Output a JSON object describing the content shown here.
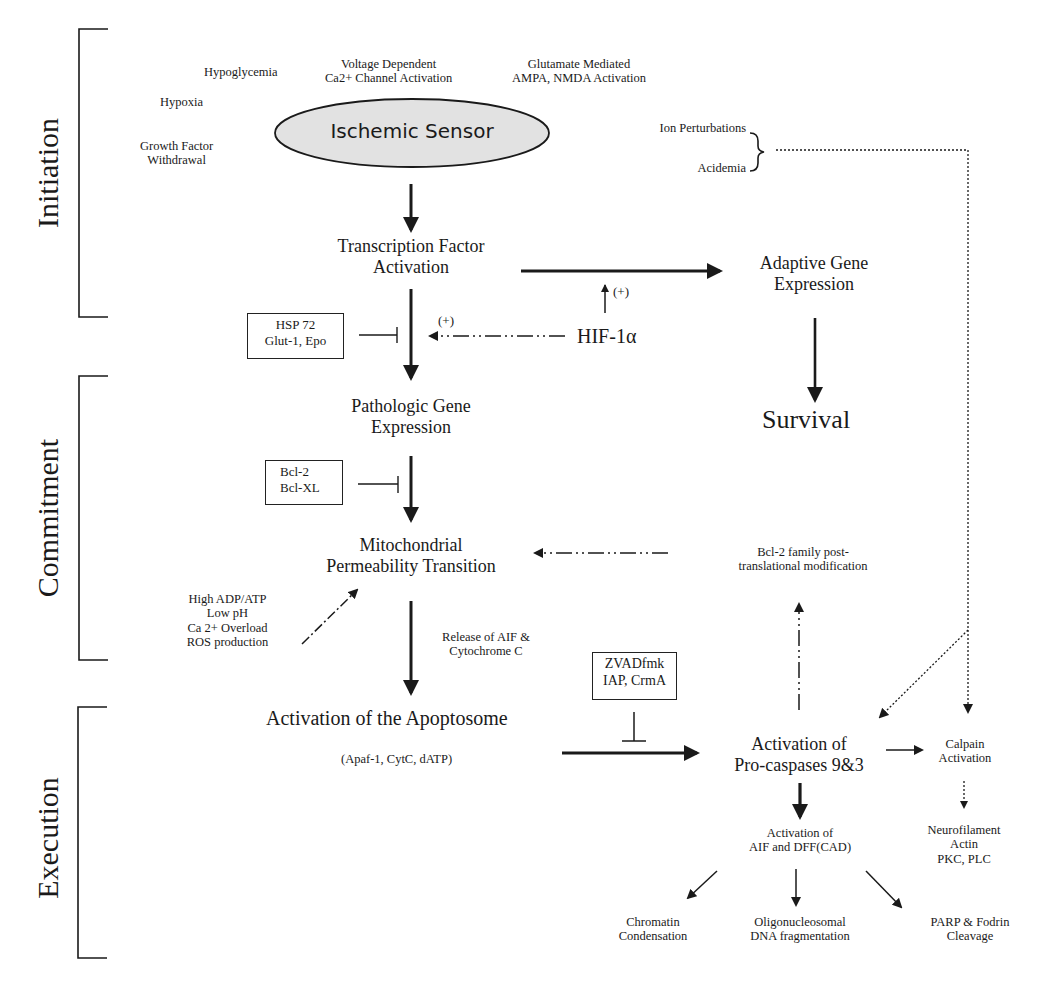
{
  "phases": [
    {
      "label": "Initiation"
    },
    {
      "label": "Commitment"
    },
    {
      "label": "Execution"
    }
  ],
  "initiation": {
    "stimuli": {
      "hypoglycemia": "Hypoglycemia",
      "hypoxia": "Hypoxia",
      "growth_factor": [
        "Growth Factor",
        "Withdrawal"
      ],
      "voltage": [
        "Voltage Dependent",
        "Ca2+ Channel Activation"
      ],
      "glutamate": [
        "Glutamate Mediated",
        "AMPA, NMDA Activation"
      ]
    },
    "sensor": "Ischemic Sensor",
    "ion_perturbations": "Ion Perturbations",
    "acidemia": "Acidemia",
    "transcription": [
      "Transcription Factor",
      "Activation"
    ],
    "adaptive": [
      "Adaptive Gene",
      "Expression"
    ],
    "plus_upper": "(+)",
    "plus_left": "(+)",
    "hif": "HIF-1α",
    "survival": "Survival"
  },
  "commitment": {
    "hsp_box": [
      "HSP 72",
      "Glut-1, Epo"
    ],
    "pathologic": [
      "Pathologic Gene",
      "Expression"
    ],
    "bcl_box": [
      "Bcl-2",
      "Bcl-XL"
    ],
    "mitochondrial": [
      "Mitochondrial",
      "Permeability Transition"
    ],
    "bcl_family": [
      "Bcl-2 family post-",
      "translational modification"
    ],
    "triggers": [
      "High ADP/ATP",
      "Low pH",
      "Ca 2+ Overload",
      "ROS production"
    ],
    "release": [
      "Release of AIF &",
      "Cytochrome C"
    ]
  },
  "execution": {
    "zvad_box": [
      "ZVADfmk",
      "IAP, CrmA"
    ],
    "apoptosome": "Activation of the Apoptosome",
    "apoptosome_sub": "(Apaf-1, CytC, dATP)",
    "procaspases": [
      "Activation of",
      "Pro-caspases 9&3"
    ],
    "calpain": [
      "Calpain",
      "Activation"
    ],
    "neurofilament": [
      "Neurofilament",
      "Actin",
      "PKC, PLC"
    ],
    "aif_dff": [
      "Activation of",
      "AIF and DFF(CAD)"
    ],
    "chromatin": [
      "Chromatin",
      "Condensation"
    ],
    "oligo": [
      "Oligonucleosomal",
      "DNA fragmentation"
    ],
    "parp": [
      "PARP & Fodrin",
      "Cleavage"
    ]
  },
  "colors": {
    "ink": "#1a1a1a",
    "ellipse_fill": "#e2e2e2",
    "background": "#ffffff"
  }
}
